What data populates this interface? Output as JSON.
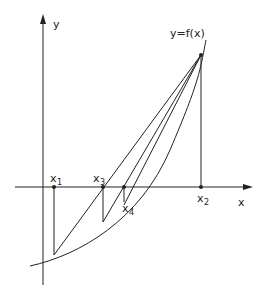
{
  "diagram": {
    "type": "regula-falsi / secant method illustration",
    "axes": {
      "x_label": "x",
      "y_label": "y"
    },
    "curve_label": "y=f(x)",
    "points": [
      {
        "id": "x1",
        "base": "x",
        "sub": "1"
      },
      {
        "id": "x2",
        "base": "x",
        "sub": "2"
      },
      {
        "id": "x3",
        "base": "x",
        "sub": "3"
      },
      {
        "id": "x4",
        "base": "x",
        "sub": "4"
      }
    ],
    "colors": {
      "ink": "#222222",
      "background": "#ffffff"
    }
  }
}
